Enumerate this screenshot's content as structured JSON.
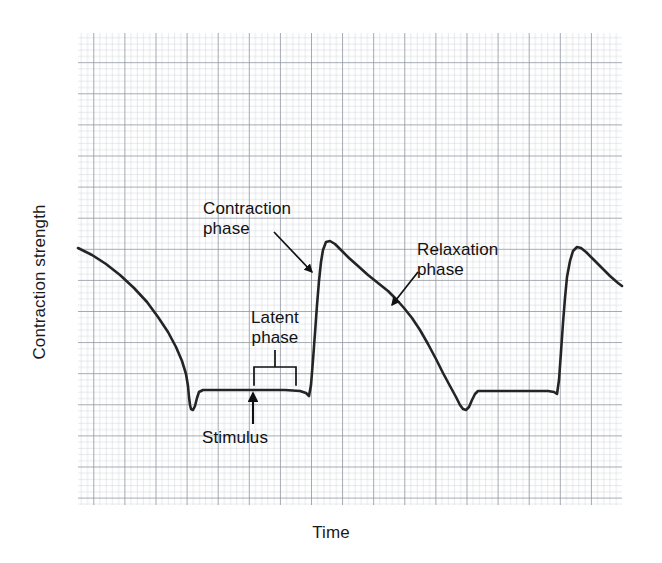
{
  "figure": {
    "kind": "myogram-recording",
    "background_color": "#ffffff",
    "trace_color": "#242424",
    "grid_minor_color": "#c9cdd6",
    "grid_major_color": "#8e949f",
    "annotation_color": "#111111"
  },
  "axes": {
    "y_label": "Contraction strength",
    "x_label": "Time",
    "plot_left_px": 78,
    "plot_top_px": 33,
    "plot_right_px": 622,
    "plot_bottom_px": 505,
    "minor_grid_px": 6.22,
    "major_grid_every": 5
  },
  "annotations": [
    {
      "id": "contraction",
      "label": "Contraction\nphase",
      "text_x": 203,
      "text_y": 199,
      "arrow": {
        "x1": 274,
        "y1": 232,
        "x2": 312,
        "y2": 272
      }
    },
    {
      "id": "relaxation",
      "label": "Relaxation\nphase",
      "text_x": 417,
      "text_y": 240,
      "arrow": {
        "x1": 418,
        "y1": 272,
        "x2": 392,
        "y2": 305
      }
    },
    {
      "id": "latent",
      "label": "Latent\nphase",
      "text_x": 238,
      "text_y": 308,
      "bracket": {
        "left": 254,
        "right": 296,
        "top": 367,
        "bottom": 385,
        "stem_top": 350
      }
    },
    {
      "id": "stimulus",
      "label": "Stimulus",
      "text_x": 202,
      "text_y": 428,
      "arrow": {
        "x1": 253,
        "y1": 424,
        "x2": 253,
        "y2": 393
      }
    }
  ],
  "chart_data": {
    "type": "line",
    "title": "",
    "xlabel": "Time",
    "ylabel": "Contraction strength",
    "subtitle": "",
    "grid": true,
    "legend": null,
    "axis_ticks": false,
    "series": [
      {
        "name": "Myogram trace",
        "color": "#242424",
        "points_px": [
          [
            78,
            248
          ],
          [
            92,
            255
          ],
          [
            106,
            264
          ],
          [
            120,
            275
          ],
          [
            134,
            288
          ],
          [
            147,
            302
          ],
          [
            158,
            317
          ],
          [
            168,
            332
          ],
          [
            176,
            347
          ],
          [
            182,
            361
          ],
          [
            186,
            374
          ],
          [
            188,
            386
          ],
          [
            189,
            397
          ],
          [
            190,
            405
          ],
          [
            191,
            409
          ],
          [
            193,
            410
          ],
          [
            195,
            406
          ],
          [
            197,
            398
          ],
          [
            199,
            392
          ],
          [
            203,
            390
          ],
          [
            215,
            390
          ],
          [
            235,
            390
          ],
          [
            260,
            390
          ],
          [
            285,
            390
          ],
          [
            300,
            391
          ],
          [
            306,
            393
          ],
          [
            309,
            396
          ],
          [
            311,
            385
          ],
          [
            313,
            360
          ],
          [
            315,
            333
          ],
          [
            317,
            305
          ],
          [
            319,
            281
          ],
          [
            321,
            262
          ],
          [
            323,
            250
          ],
          [
            326,
            242
          ],
          [
            330,
            241
          ],
          [
            335,
            244
          ],
          [
            341,
            250
          ],
          [
            349,
            258
          ],
          [
            358,
            266
          ],
          [
            368,
            275
          ],
          [
            378,
            283
          ],
          [
            388,
            291
          ],
          [
            396,
            299
          ],
          [
            404,
            308
          ],
          [
            412,
            318
          ],
          [
            420,
            330
          ],
          [
            428,
            344
          ],
          [
            436,
            359
          ],
          [
            443,
            373
          ],
          [
            450,
            386
          ],
          [
            456,
            397
          ],
          [
            460,
            405
          ],
          [
            463,
            409
          ],
          [
            466,
            410
          ],
          [
            469,
            407
          ],
          [
            472,
            400
          ],
          [
            475,
            394
          ],
          [
            478,
            391
          ],
          [
            490,
            391
          ],
          [
            510,
            391
          ],
          [
            530,
            391
          ],
          [
            548,
            391
          ],
          [
            554,
            392
          ],
          [
            557,
            394
          ],
          [
            559,
            380
          ],
          [
            561,
            352
          ],
          [
            563,
            323
          ],
          [
            565,
            298
          ],
          [
            567,
            277
          ],
          [
            570,
            261
          ],
          [
            573,
            251
          ],
          [
            577,
            247
          ],
          [
            581,
            248
          ],
          [
            586,
            252
          ],
          [
            593,
            259
          ],
          [
            601,
            267
          ],
          [
            610,
            276
          ],
          [
            618,
            283
          ],
          [
            622,
            286
          ]
        ]
      }
    ]
  }
}
